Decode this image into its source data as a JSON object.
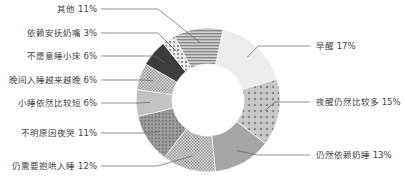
{
  "chart_data": {
    "type": "pie",
    "variant": "donut",
    "title": "",
    "start_angle_deg": 12,
    "direction": "clockwise",
    "categories": [
      "早醒",
      "夜醒仍然比较多",
      "仍然依赖奶睡",
      "仍需要抱哄入睡",
      "不明原因夜哭",
      "小睡依然比较短",
      "晚间入睡越来越晚",
      "不愿意睡小床",
      "依赖安抚奶嘴",
      "其他"
    ],
    "values": [
      17,
      15,
      13,
      12,
      11,
      6,
      6,
      6,
      3,
      11
    ],
    "unit": "%",
    "labels": [
      "早醒 17%",
      "夜醒仍然比较多 15%",
      "仍然依赖奶睡 13%",
      "仍需要抱哄入睡 12%",
      "不明原因夜哭 11%",
      "小睡依然比较短 6%",
      "晚间入睡越来越晚 6%",
      "不愿意睡小床 6%",
      "依赖安抚奶嘴 3%",
      "其他 11%"
    ],
    "legend": "none (leader-line labels)",
    "colors": [
      "#ececec",
      "#b9b9b9",
      "#a6a6a6",
      "#c4c4c4",
      "#8c8c8c",
      "#c2c2c2",
      "#d2d2d2",
      "#3c3c3c",
      "#e0e0e0",
      "#a9a9a9"
    ],
    "patterns": [
      "solid",
      "large-dots",
      "solid",
      "checker",
      "dots",
      "solid",
      "checker",
      "solid",
      "dots",
      "horizontal-lines"
    ]
  },
  "label_positions": [
    {
      "side": "right",
      "x": 316,
      "y": 46
    },
    {
      "side": "right",
      "x": 316,
      "y": 102
    },
    {
      "side": "right",
      "x": 316,
      "y": 155
    },
    {
      "side": "left",
      "x": 97,
      "y": 166
    },
    {
      "side": "left",
      "x": 97,
      "y": 133
    },
    {
      "side": "left",
      "x": 97,
      "y": 103
    },
    {
      "side": "left",
      "x": 97,
      "y": 80
    },
    {
      "side": "left",
      "x": 97,
      "y": 56
    },
    {
      "side": "left",
      "x": 97,
      "y": 33
    },
    {
      "side": "left",
      "x": 97,
      "y": 9
    }
  ]
}
